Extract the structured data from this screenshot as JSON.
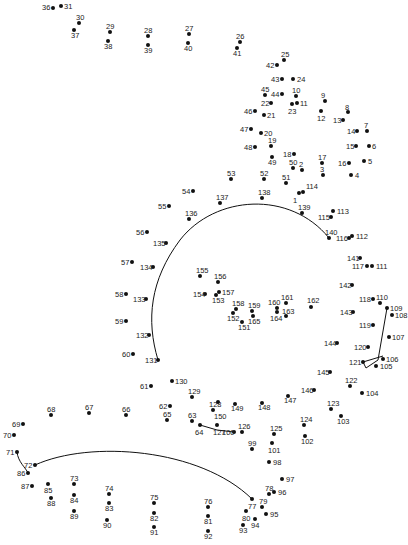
{
  "puzzle": {
    "type": "connect-the-dots",
    "line_color": "#111111",
    "dot_color": "#111111",
    "dots": [
      {
        "n": "1",
        "x": 299,
        "y": 193,
        "lx": 293,
        "ly": 197
      },
      {
        "n": "2",
        "x": 302,
        "y": 170,
        "lx": 299,
        "ly": 161
      },
      {
        "n": "3",
        "x": 323,
        "y": 175,
        "lx": 320,
        "ly": 166
      },
      {
        "n": "4",
        "x": 351,
        "y": 175,
        "lx": 355,
        "ly": 172
      },
      {
        "n": "5",
        "x": 364,
        "y": 161,
        "lx": 368,
        "ly": 158
      },
      {
        "n": "6",
        "x": 369,
        "y": 146,
        "lx": 372,
        "ly": 143
      },
      {
        "n": "7",
        "x": 367,
        "y": 131,
        "lx": 364,
        "ly": 122
      },
      {
        "n": "8",
        "x": 348,
        "y": 112,
        "lx": 345,
        "ly": 104
      },
      {
        "n": "9",
        "x": 325,
        "y": 101,
        "lx": 321,
        "ly": 92
      },
      {
        "n": "10",
        "x": 296,
        "y": 96,
        "lx": 292,
        "ly": 87
      },
      {
        "n": "11",
        "x": 297,
        "y": 103,
        "lx": 300,
        "ly": 100
      },
      {
        "n": "12",
        "x": 321,
        "y": 111,
        "lx": 317,
        "ly": 115
      },
      {
        "n": "13",
        "x": 343,
        "y": 120,
        "lx": 333,
        "ly": 117
      },
      {
        "n": "14",
        "x": 357,
        "y": 131,
        "lx": 347,
        "ly": 128
      },
      {
        "n": "15",
        "x": 356,
        "y": 146,
        "lx": 346,
        "ly": 143
      },
      {
        "n": "16",
        "x": 349,
        "y": 163,
        "lx": 338,
        "ly": 160
      },
      {
        "n": "17",
        "x": 322,
        "y": 163,
        "lx": 318,
        "ly": 154
      },
      {
        "n": "18",
        "x": 294,
        "y": 154,
        "lx": 283,
        "ly": 151
      },
      {
        "n": "19",
        "x": 271,
        "y": 146,
        "lx": 268,
        "ly": 137
      },
      {
        "n": "20",
        "x": 261,
        "y": 133,
        "lx": 264,
        "ly": 130
      },
      {
        "n": "21",
        "x": 264,
        "y": 115,
        "lx": 267,
        "ly": 112
      },
      {
        "n": "22",
        "x": 271,
        "y": 103,
        "lx": 261,
        "ly": 100
      },
      {
        "n": "23",
        "x": 292,
        "y": 104,
        "lx": 288,
        "ly": 108
      },
      {
        "n": "24",
        "x": 293,
        "y": 79,
        "lx": 297,
        "ly": 76
      },
      {
        "n": "25",
        "x": 284,
        "y": 60,
        "lx": 281,
        "ly": 51
      },
      {
        "n": "26",
        "x": 240,
        "y": 42,
        "lx": 236,
        "ly": 33
      },
      {
        "n": "27",
        "x": 189,
        "y": 34,
        "lx": 185,
        "ly": 25
      },
      {
        "n": "28",
        "x": 148,
        "y": 36,
        "lx": 144,
        "ly": 27
      },
      {
        "n": "29",
        "x": 110,
        "y": 32,
        "lx": 106,
        "ly": 23
      },
      {
        "n": "30",
        "x": 79,
        "y": 23,
        "lx": 76,
        "ly": 14
      },
      {
        "n": "31",
        "x": 61,
        "y": 6,
        "lx": 64,
        "ly": 3
      },
      {
        "n": "36",
        "x": 53,
        "y": 8,
        "lx": 42,
        "ly": 4
      },
      {
        "n": "37",
        "x": 74,
        "y": 30,
        "lx": 71,
        "ly": 32
      },
      {
        "n": "38",
        "x": 108,
        "y": 41,
        "lx": 104,
        "ly": 43
      },
      {
        "n": "39",
        "x": 148,
        "y": 45,
        "lx": 144,
        "ly": 47
      },
      {
        "n": "40",
        "x": 188,
        "y": 43,
        "lx": 184,
        "ly": 45
      },
      {
        "n": "41",
        "x": 237,
        "y": 48,
        "lx": 233,
        "ly": 50
      },
      {
        "n": "42",
        "x": 277,
        "y": 65,
        "lx": 266,
        "ly": 62
      },
      {
        "n": "43",
        "x": 282,
        "y": 79,
        "lx": 271,
        "ly": 76
      },
      {
        "n": "44",
        "x": 282,
        "y": 94,
        "lx": 271,
        "ly": 91
      },
      {
        "n": "45",
        "x": 265,
        "y": 95,
        "lx": 261,
        "ly": 86
      },
      {
        "n": "46",
        "x": 255,
        "y": 111,
        "lx": 244,
        "ly": 108
      },
      {
        "n": "47",
        "x": 251,
        "y": 129,
        "lx": 240,
        "ly": 126
      },
      {
        "n": "48",
        "x": 255,
        "y": 147,
        "lx": 244,
        "ly": 144
      },
      {
        "n": "49",
        "x": 272,
        "y": 157,
        "lx": 268,
        "ly": 159
      },
      {
        "n": "50",
        "x": 293,
        "y": 168,
        "lx": 289,
        "ly": 159
      },
      {
        "n": "51",
        "x": 286,
        "y": 183,
        "lx": 282,
        "ly": 174
      },
      {
        "n": "52",
        "x": 264,
        "y": 179,
        "lx": 260,
        "ly": 170
      },
      {
        "n": "53",
        "x": 231,
        "y": 179,
        "lx": 227,
        "ly": 170
      },
      {
        "n": "54",
        "x": 193,
        "y": 191,
        "lx": 182,
        "ly": 188
      },
      {
        "n": "55",
        "x": 169,
        "y": 206,
        "lx": 158,
        "ly": 203
      },
      {
        "n": "56",
        "x": 147,
        "y": 232,
        "lx": 136,
        "ly": 229
      },
      {
        "n": "57",
        "x": 132,
        "y": 262,
        "lx": 121,
        "ly": 259
      },
      {
        "n": "58",
        "x": 126,
        "y": 294,
        "lx": 115,
        "ly": 291
      },
      {
        "n": "59",
        "x": 126,
        "y": 321,
        "lx": 115,
        "ly": 318
      },
      {
        "n": "60",
        "x": 133,
        "y": 354,
        "lx": 122,
        "ly": 351
      },
      {
        "n": "61",
        "x": 151,
        "y": 386,
        "lx": 140,
        "ly": 383
      },
      {
        "n": "62",
        "x": 170,
        "y": 406,
        "lx": 159,
        "ly": 403
      },
      {
        "n": "63",
        "x": 192,
        "y": 421,
        "lx": 188,
        "ly": 412
      },
      {
        "n": "64",
        "x": 200,
        "y": 425,
        "lx": 195,
        "ly": 429
      },
      {
        "n": "65",
        "x": 167,
        "y": 420,
        "lx": 163,
        "ly": 411
      },
      {
        "n": "66",
        "x": 126,
        "y": 415,
        "lx": 122,
        "ly": 406
      },
      {
        "n": "67",
        "x": 89,
        "y": 413,
        "lx": 85,
        "ly": 404
      },
      {
        "n": "68",
        "x": 51,
        "y": 415,
        "lx": 47,
        "ly": 406
      },
      {
        "n": "69",
        "x": 23,
        "y": 424,
        "lx": 12,
        "ly": 421
      },
      {
        "n": "70",
        "x": 14,
        "y": 435,
        "lx": 3,
        "ly": 432
      },
      {
        "n": "71",
        "x": 17,
        "y": 452,
        "lx": 6,
        "ly": 449
      },
      {
        "n": "72",
        "x": 35,
        "y": 465,
        "lx": 24,
        "ly": 462
      },
      {
        "n": "73",
        "x": 74,
        "y": 484,
        "lx": 70,
        "ly": 475
      },
      {
        "n": "74",
        "x": 109,
        "y": 494,
        "lx": 105,
        "ly": 485
      },
      {
        "n": "75",
        "x": 154,
        "y": 503,
        "lx": 150,
        "ly": 494
      },
      {
        "n": "76",
        "x": 208,
        "y": 507,
        "lx": 204,
        "ly": 498
      },
      {
        "n": "77",
        "x": 252,
        "y": 499,
        "lx": 248,
        "ly": 503
      },
      {
        "n": "78",
        "x": 269,
        "y": 494,
        "lx": 265,
        "ly": 485
      },
      {
        "n": "79",
        "x": 262,
        "y": 507,
        "lx": 259,
        "ly": 498
      },
      {
        "n": "80",
        "x": 246,
        "y": 511,
        "lx": 242,
        "ly": 515
      },
      {
        "n": "81",
        "x": 208,
        "y": 516,
        "lx": 204,
        "ly": 518
      },
      {
        "n": "82",
        "x": 154,
        "y": 513,
        "lx": 150,
        "ly": 515
      },
      {
        "n": "83",
        "x": 109,
        "y": 503,
        "lx": 105,
        "ly": 505
      },
      {
        "n": "84",
        "x": 74,
        "y": 495,
        "lx": 70,
        "ly": 497
      },
      {
        "n": "85",
        "x": 48,
        "y": 484,
        "lx": 44,
        "ly": 487
      },
      {
        "n": "86",
        "x": 28,
        "y": 473,
        "lx": 17,
        "ly": 470
      },
      {
        "n": "87",
        "x": 32,
        "y": 486,
        "lx": 21,
        "ly": 483
      },
      {
        "n": "88",
        "x": 51,
        "y": 498,
        "lx": 47,
        "ly": 500
      },
      {
        "n": "89",
        "x": 74,
        "y": 511,
        "lx": 70,
        "ly": 513
      },
      {
        "n": "90",
        "x": 107,
        "y": 520,
        "lx": 103,
        "ly": 522
      },
      {
        "n": "91",
        "x": 154,
        "y": 527,
        "lx": 150,
        "ly": 529
      },
      {
        "n": "92",
        "x": 208,
        "y": 531,
        "lx": 204,
        "ly": 533
      },
      {
        "n": "93",
        "x": 243,
        "y": 525,
        "lx": 239,
        "ly": 527
      },
      {
        "n": "94",
        "x": 255,
        "y": 519,
        "lx": 251,
        "ly": 522
      },
      {
        "n": "95",
        "x": 266,
        "y": 514,
        "lx": 270,
        "ly": 511
      },
      {
        "n": "96",
        "x": 274,
        "y": 492,
        "lx": 278,
        "ly": 489
      },
      {
        "n": "97",
        "x": 282,
        "y": 479,
        "lx": 286,
        "ly": 476
      },
      {
        "n": "98",
        "x": 269,
        "y": 462,
        "lx": 273,
        "ly": 459
      },
      {
        "n": "99",
        "x": 252,
        "y": 449,
        "lx": 248,
        "ly": 440
      },
      {
        "n": "100",
        "x": 234,
        "y": 432,
        "lx": 222,
        "ly": 429
      },
      {
        "n": "101",
        "x": 272,
        "y": 443,
        "lx": 268,
        "ly": 447
      },
      {
        "n": "102",
        "x": 305,
        "y": 436,
        "lx": 301,
        "ly": 438
      },
      {
        "n": "103",
        "x": 341,
        "y": 416,
        "lx": 337,
        "ly": 418
      },
      {
        "n": "104",
        "x": 362,
        "y": 393,
        "lx": 366,
        "ly": 390
      },
      {
        "n": "105",
        "x": 376,
        "y": 366,
        "lx": 380,
        "ly": 363
      },
      {
        "n": "106",
        "x": 383,
        "y": 359,
        "lx": 386,
        "ly": 356
      },
      {
        "n": "107",
        "x": 389,
        "y": 337,
        "lx": 392,
        "ly": 334
      },
      {
        "n": "108",
        "x": 392,
        "y": 315,
        "lx": 395,
        "ly": 312
      },
      {
        "n": "109",
        "x": 387,
        "y": 308,
        "lx": 390,
        "ly": 305
      },
      {
        "n": "110",
        "x": 380,
        "y": 303,
        "lx": 376,
        "ly": 294
      },
      {
        "n": "111",
        "x": 372,
        "y": 266,
        "lx": 376,
        "ly": 263
      },
      {
        "n": "112",
        "x": 352,
        "y": 236,
        "lx": 356,
        "ly": 233
      },
      {
        "n": "113",
        "x": 333,
        "y": 211,
        "lx": 337,
        "ly": 208
      },
      {
        "n": "114",
        "x": 303,
        "y": 192,
        "lx": 306,
        "ly": 183
      },
      {
        "n": "115",
        "x": 331,
        "y": 217,
        "lx": 318,
        "ly": 214
      },
      {
        "n": "116",
        "x": 349,
        "y": 238,
        "lx": 336,
        "ly": 235
      },
      {
        "n": "117",
        "x": 367,
        "y": 266,
        "lx": 352,
        "ly": 263
      },
      {
        "n": "118",
        "x": 373,
        "y": 299,
        "lx": 359,
        "ly": 296
      },
      {
        "n": "119",
        "x": 373,
        "y": 325,
        "lx": 359,
        "ly": 322
      },
      {
        "n": "120",
        "x": 368,
        "y": 347,
        "lx": 354,
        "ly": 344
      },
      {
        "n": "121",
        "x": 363,
        "y": 362,
        "lx": 349,
        "ly": 359
      },
      {
        "n": "122",
        "x": 350,
        "y": 386,
        "lx": 345,
        "ly": 377
      },
      {
        "n": "123",
        "x": 331,
        "y": 409,
        "lx": 327,
        "ly": 400
      },
      {
        "n": "124",
        "x": 304,
        "y": 425,
        "lx": 300,
        "ly": 416
      },
      {
        "n": "125",
        "x": 274,
        "y": 434,
        "lx": 270,
        "ly": 425
      },
      {
        "n": "126",
        "x": 242,
        "y": 432,
        "lx": 238,
        "ly": 423
      },
      {
        "n": "127",
        "x": 217,
        "y": 425,
        "lx": 213,
        "ly": 429
      },
      {
        "n": "128",
        "x": 213,
        "y": 410,
        "lx": 209,
        "ly": 401
      },
      {
        "n": "129",
        "x": 192,
        "y": 397,
        "lx": 188,
        "ly": 388
      },
      {
        "n": "130",
        "x": 172,
        "y": 381,
        "lx": 175,
        "ly": 378
      },
      {
        "n": "131",
        "x": 158,
        "y": 360,
        "lx": 145,
        "ly": 357
      },
      {
        "n": "132",
        "x": 149,
        "y": 335,
        "lx": 136,
        "ly": 332
      },
      {
        "n": "133",
        "x": 146,
        "y": 299,
        "lx": 133,
        "ly": 296
      },
      {
        "n": "134",
        "x": 153,
        "y": 267,
        "lx": 140,
        "ly": 264
      },
      {
        "n": "135",
        "x": 166,
        "y": 243,
        "lx": 153,
        "ly": 240
      },
      {
        "n": "136",
        "x": 189,
        "y": 219,
        "lx": 185,
        "ly": 210
      },
      {
        "n": "137",
        "x": 220,
        "y": 203,
        "lx": 216,
        "ly": 194
      },
      {
        "n": "138",
        "x": 262,
        "y": 198,
        "lx": 258,
        "ly": 189
      },
      {
        "n": "139",
        "x": 302,
        "y": 213,
        "lx": 298,
        "ly": 204
      },
      {
        "n": "140",
        "x": 329,
        "y": 238,
        "lx": 325,
        "ly": 229
      },
      {
        "n": "141",
        "x": 360,
        "y": 258,
        "lx": 347,
        "ly": 255
      },
      {
        "n": "142",
        "x": 352,
        "y": 285,
        "lx": 339,
        "ly": 282
      },
      {
        "n": "143",
        "x": 353,
        "y": 312,
        "lx": 340,
        "ly": 309
      },
      {
        "n": "144",
        "x": 337,
        "y": 343,
        "lx": 324,
        "ly": 340
      },
      {
        "n": "145",
        "x": 330,
        "y": 372,
        "lx": 317,
        "ly": 369
      },
      {
        "n": "146",
        "x": 314,
        "y": 390,
        "lx": 301,
        "ly": 387
      },
      {
        "n": "147",
        "x": 288,
        "y": 396,
        "lx": 284,
        "ly": 397
      },
      {
        "n": "148",
        "x": 262,
        "y": 403,
        "lx": 258,
        "ly": 404
      },
      {
        "n": "149",
        "x": 235,
        "y": 404,
        "lx": 231,
        "ly": 405
      },
      {
        "n": "150",
        "x": 218,
        "y": 402,
        "lx": 214,
        "ly": 413
      },
      {
        "n": "151",
        "x": 242,
        "y": 322,
        "lx": 238,
        "ly": 324
      },
      {
        "n": "152",
        "x": 233,
        "y": 313,
        "lx": 227,
        "ly": 315
      },
      {
        "n": "153",
        "x": 216,
        "y": 295,
        "lx": 212,
        "ly": 297
      },
      {
        "n": "154",
        "x": 205,
        "y": 294,
        "lx": 193,
        "ly": 291
      },
      {
        "n": "155",
        "x": 200,
        "y": 276,
        "lx": 196,
        "ly": 267
      },
      {
        "n": "156",
        "x": 218,
        "y": 282,
        "lx": 214,
        "ly": 273
      },
      {
        "n": "157",
        "x": 219,
        "y": 292,
        "lx": 222,
        "ly": 289
      },
      {
        "n": "158",
        "x": 236,
        "y": 309,
        "lx": 232,
        "ly": 300
      },
      {
        "n": "159",
        "x": 252,
        "y": 311,
        "lx": 248,
        "ly": 302
      },
      {
        "n": "160",
        "x": 277,
        "y": 308,
        "lx": 268,
        "ly": 299
      },
      {
        "n": "161",
        "x": 286,
        "y": 303,
        "lx": 281,
        "ly": 294
      },
      {
        "n": "162",
        "x": 311,
        "y": 307,
        "lx": 307,
        "ly": 297
      },
      {
        "n": "163",
        "x": 286,
        "y": 316,
        "lx": 282,
        "ly": 308
      },
      {
        "n": "164",
        "x": 277,
        "y": 312,
        "lx": 270,
        "ly": 315
      },
      {
        "n": "165",
        "x": 253,
        "y": 316,
        "lx": 248,
        "ly": 318
      }
    ]
  }
}
